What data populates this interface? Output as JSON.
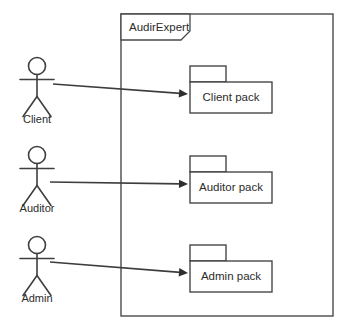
{
  "diagram": {
    "type": "uml-package-diagram",
    "background_color": "#ffffff",
    "line_color": "#3a3a3a",
    "text_color": "#2b2b2b",
    "boundary": {
      "label": "AudirExpert",
      "x": 121,
      "y": 14,
      "width": 212,
      "height": 302,
      "tab": {
        "x": 121,
        "y": 14,
        "width": 69,
        "height": 26,
        "clip": 9
      }
    },
    "actors": [
      {
        "name": "Client",
        "label": "Client",
        "cx": 37,
        "head_cy": 66,
        "label_x": 37,
        "label_y": 123
      },
      {
        "name": "Auditor",
        "label": "Auditor",
        "cx": 37,
        "head_cy": 155,
        "label_x": 37,
        "label_y": 212
      },
      {
        "name": "Admin",
        "label": "Admin",
        "cx": 37,
        "head_cy": 245,
        "label_x": 37,
        "label_y": 302
      }
    ],
    "packages": [
      {
        "name": "client-pack",
        "label": "Client pack",
        "x": 190,
        "y": 82,
        "width": 82,
        "height": 31,
        "tab_width": 36,
        "tab_height": 16
      },
      {
        "name": "auditor-pack",
        "label": "Auditor pack",
        "x": 190,
        "y": 172,
        "width": 82,
        "height": 31,
        "tab_width": 36,
        "tab_height": 16
      },
      {
        "name": "admin-pack",
        "label": "Admin pack",
        "x": 190,
        "y": 261,
        "width": 82,
        "height": 31,
        "tab_width": 36,
        "tab_height": 16
      }
    ],
    "associations": [
      {
        "name": "client-to-client-pack",
        "from": "Client",
        "to": "Client pack",
        "x1": 53,
        "y1": 84,
        "x2": 188,
        "y2": 94
      },
      {
        "name": "auditor-to-auditor-pack",
        "from": "Auditor",
        "to": "Auditor pack",
        "x1": 50,
        "y1": 182,
        "x2": 188,
        "y2": 184
      },
      {
        "name": "admin-to-admin-pack",
        "from": "Admin",
        "to": "Admin pack",
        "x1": 50,
        "y1": 262,
        "x2": 188,
        "y2": 273
      }
    ],
    "caption": {
      "text": "",
      "visible": false
    }
  }
}
